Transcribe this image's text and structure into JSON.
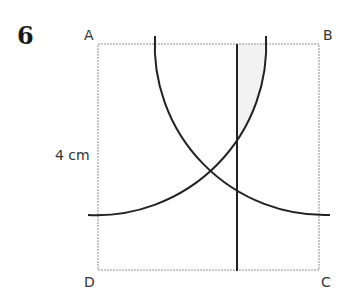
{
  "question_number": "6",
  "labels": {
    "A": "A",
    "B": "B",
    "C": "C",
    "D": "D",
    "side_length": "4 cm"
  },
  "colors": {
    "square_border": "#b8b8b8",
    "construction_lines": "#222222",
    "shaded_region": "#f2f2f2"
  },
  "diagram": {
    "shape": "square ABCD",
    "side": "4 cm",
    "arcs": [
      {
        "center": "A",
        "description": "arc centred at A crossing AB and BC"
      },
      {
        "center": "B",
        "description": "arc centred at B crossing AB and AD"
      }
    ],
    "vertical_line": "line perpendicular to AB, to the right of the arcs' intersection",
    "shaded": "region between vertical line, AB, and arc centred at A"
  }
}
